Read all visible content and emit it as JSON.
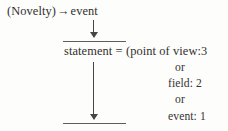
{
  "diagram": {
    "kind": "linguistic-derivation-diagram",
    "ink_color": "#31302e",
    "rule_color": "#4a4846",
    "background_color": "#fdfdfb",
    "line1": {
      "source": "(Novelty)",
      "arrow": "→",
      "target": "event",
      "full_text": "(Novelty) → event"
    },
    "line2": {
      "label": "statement",
      "equals": "=",
      "open_paren": "(",
      "first_alternative": "point of view:3",
      "full_text": "statement = (point of view:3"
    },
    "alternatives": [
      {
        "connector": "or",
        "item": "field: 2"
      },
      {
        "connector": "or",
        "item": "event: 1"
      }
    ],
    "alt_or_1": "or",
    "alt_field": "field: 2",
    "alt_or_2": "or",
    "alt_event": "event: 1",
    "arrows": [
      {
        "name": "arrow-novelty-to-statement",
        "direction": "down"
      },
      {
        "name": "arrow-statement-to-blank",
        "direction": "down"
      }
    ],
    "rules": [
      {
        "name": "rule-above-statement"
      },
      {
        "name": "rule-bottom-blank"
      }
    ]
  }
}
